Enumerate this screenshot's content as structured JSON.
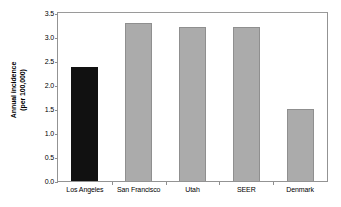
{
  "chart_data": {
    "type": "bar",
    "title": "",
    "subtitle": "",
    "xlabel": "",
    "ylabel": "Annual incidence (per 100,000)",
    "ylabel_lines": [
      "Annual incidence",
      "(per 100,000)"
    ],
    "categories": [
      "Los Angeles",
      "San Francisco",
      "Utah",
      "SEER",
      "Denmark"
    ],
    "values": [
      2.37,
      3.3,
      3.2,
      3.2,
      1.49
    ],
    "ylim": [
      0.0,
      3.5
    ],
    "ytick_values": [
      0.0,
      0.5,
      1.0,
      1.5,
      2.0,
      2.5,
      3.0,
      3.5
    ],
    "ytick_labels": [
      "0.0",
      "0.5",
      "1.0",
      "1.5",
      "2.0",
      "2.5",
      "3.0",
      "3.5"
    ],
    "grid": false,
    "legend": null,
    "legend_position": "none",
    "bar_colors": [
      "#111111",
      "#ababab",
      "#ababab",
      "#ababab",
      "#ababab"
    ],
    "highlight_category": "Los Angeles",
    "annotations": []
  },
  "colors": {
    "background": "#ffffff",
    "axis": "#939393",
    "bar_gray_fill": "#ababab",
    "bar_gray_edge": "#8f8f8f",
    "bar_black_fill": "#111111",
    "text": "#000000"
  }
}
